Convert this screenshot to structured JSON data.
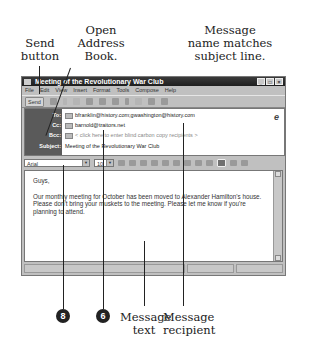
{
  "annotations": {
    "send_button": [
      "Send",
      "button"
    ],
    "address_book": [
      "Open",
      "Address",
      "Book."
    ],
    "message_name": [
      "Message",
      "name matches",
      "subject line."
    ],
    "message_text": [
      "Message",
      "text"
    ],
    "message_recipient": [
      "Message",
      "recipient"
    ],
    "step_8": "8",
    "step_6": "6"
  },
  "window": {
    "title": "Meeting of the Revolutionary War Club",
    "controls": [
      "_",
      "□",
      "×"
    ]
  },
  "menubar": [
    "File",
    "Edit",
    "View",
    "Insert",
    "Format",
    "Tools",
    "Compose",
    "Help"
  ],
  "toolbar": {
    "send_label": "Send",
    "icons": [
      "undo-icon",
      "cut-icon",
      "copy-icon",
      "paste-icon",
      "address-book-icon",
      "check-names-icon",
      "attach-icon",
      "signature-icon",
      "vcard-icon",
      "encrypt-icon"
    ]
  },
  "headers": {
    "to_label": "To:",
    "to_value": "bfranklin@history.com;gwashington@history.com",
    "cc_label": "Cc:",
    "cc_value": "barnold@traitors.net",
    "bcc_label": "Bcc:",
    "bcc_value": "< click here to enter blind carbon copy recipients >",
    "subject_label": "Subject:",
    "subject_value": "Meeting of the Revolutionary War Club"
  },
  "format": {
    "font": "Arial",
    "size": "10"
  },
  "body": {
    "greeting": "Guys,",
    "text": "Our monthly meeting for October has been moved to Alexander Hamilton's house. Please don't bring your muskets to the meeting. Please let me know if you're planning to attend."
  }
}
